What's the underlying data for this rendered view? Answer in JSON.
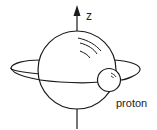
{
  "diagram": {
    "axis_label": "z",
    "particle_label": "proton",
    "colors": {
      "stroke": "#1a1a1a",
      "background": "#ffffff"
    }
  }
}
